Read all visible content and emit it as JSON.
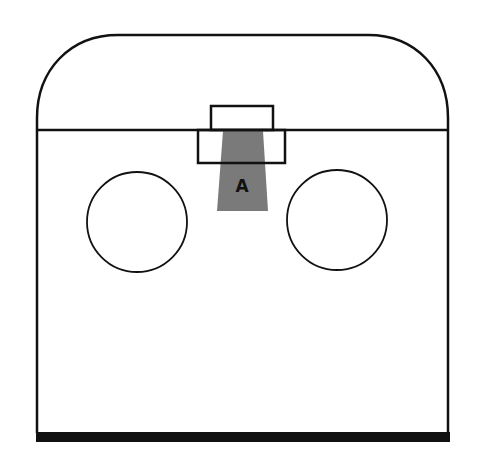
{
  "diagram": {
    "labels": {
      "region_a": "A"
    },
    "colors": {
      "stroke": "#111111",
      "shaded_region": "#7a7a7a",
      "background": "#ffffff"
    }
  }
}
